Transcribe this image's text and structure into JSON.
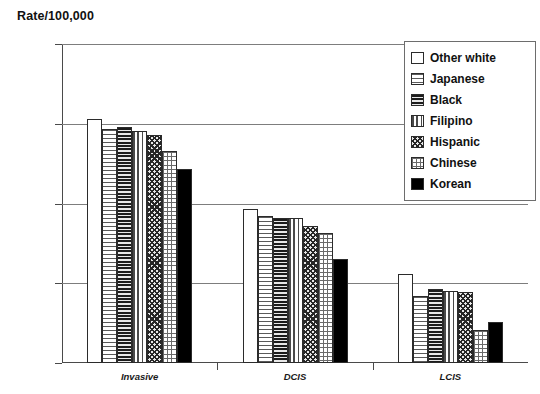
{
  "chart_data": {
    "type": "bar",
    "title": "",
    "ylabel": "Rate/100,000",
    "xlabel": "",
    "yscale": "log",
    "ylim": [
      0.1,
      1000
    ],
    "ytick_labels": [
      "1000",
      "100",
      "10",
      "1",
      "0.1"
    ],
    "ytick_values": [
      1000,
      100,
      10,
      1,
      0.1
    ],
    "grid": true,
    "legend_position": "top-right",
    "categories": [
      "Invasive",
      "DCIS",
      "LCIS"
    ],
    "series": [
      {
        "name": "Other white",
        "pattern": "solid-white",
        "values": [
          115,
          8.5,
          1.3
        ]
      },
      {
        "name": "Japanese",
        "pattern": "horizontal-light",
        "values": [
          85,
          7.0,
          0.7
        ]
      },
      {
        "name": "Black",
        "pattern": "horizontal-dense",
        "values": [
          92,
          6.6,
          0.85
        ]
      },
      {
        "name": "Filipino",
        "pattern": "vertical-lines",
        "values": [
          80,
          6.5,
          0.8
        ]
      },
      {
        "name": "Hispanic",
        "pattern": "diagonal-crosshatch",
        "values": [
          72,
          5.2,
          0.78
        ]
      },
      {
        "name": "Chinese",
        "pattern": "grid-light",
        "values": [
          45,
          4.3,
          0.26
        ]
      },
      {
        "name": "Korean",
        "pattern": "solid-black",
        "values": [
          27,
          2.0,
          0.33
        ]
      }
    ]
  },
  "legend": {
    "items": [
      {
        "label": "Other white"
      },
      {
        "label": "Japanese"
      },
      {
        "label": "Black"
      },
      {
        "label": "Filipino"
      },
      {
        "label": "Hispanic"
      },
      {
        "label": "Chinese"
      },
      {
        "label": "Korean"
      }
    ]
  },
  "colors": {
    "axis": "#4a4a4a",
    "gridline": "#7d7d7d",
    "bar_outline": "#2b2b2b",
    "text": "#111111",
    "background": "#ffffff"
  }
}
